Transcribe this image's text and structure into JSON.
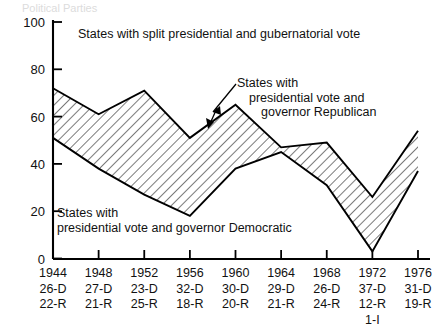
{
  "figure": {
    "top_partial_text": "Political Parties",
    "background_color": "#ffffff",
    "line_color": "#000000",
    "hatch_color": "#333333"
  },
  "yaxis": {
    "ticks": [
      "0",
      "20",
      "40",
      "60",
      "80",
      "100"
    ],
    "min": 0,
    "max": 100
  },
  "xaxis": {
    "columns": [
      {
        "year": "1944",
        "dem": "26-D",
        "rep": "22-R",
        "ind": ""
      },
      {
        "year": "1948",
        "dem": "27-D",
        "rep": "21-R",
        "ind": ""
      },
      {
        "year": "1952",
        "dem": "23-D",
        "rep": "25-R",
        "ind": ""
      },
      {
        "year": "1956",
        "dem": "32-D",
        "rep": "18-R",
        "ind": ""
      },
      {
        "year": "1960",
        "dem": "30-D",
        "rep": "20-R",
        "ind": ""
      },
      {
        "year": "1964",
        "dem": "29-D",
        "rep": "21-R",
        "ind": ""
      },
      {
        "year": "1968",
        "dem": "26-D",
        "rep": "24-R",
        "ind": ""
      },
      {
        "year": "1972",
        "dem": "37-D",
        "rep": "12-R",
        "ind": "1-I"
      },
      {
        "year": "1976",
        "dem": "31-D",
        "rep": "19-R",
        "ind": ""
      }
    ]
  },
  "annotations": {
    "split_label": "States with split presidential and gubernatorial vote",
    "republican_label_line1": "States with",
    "republican_label_line2": "presidential vote and",
    "republican_label_line3": "governor Republican",
    "democratic_label_line1": "States with",
    "democratic_label_line2": "presidential vote and governor Democratic"
  },
  "chart_data": {
    "type": "area",
    "title": "States with split presidential and gubernatorial vote",
    "xlabel": "",
    "ylabel": "",
    "ylim": [
      0,
      100
    ],
    "grid": false,
    "legend_position": "inline-annotations",
    "categories": [
      "1944",
      "1948",
      "1952",
      "1956",
      "1960",
      "1964",
      "1968",
      "1972",
      "1976"
    ],
    "series": [
      {
        "name": "States with presidential vote and governor Republican (upper boundary)",
        "values": [
          72,
          61,
          71,
          51,
          65,
          47,
          49,
          26,
          54
        ]
      },
      {
        "name": "States with presidential vote and governor Democratic (lower boundary)",
        "values": [
          51,
          38,
          27,
          18,
          38,
          45,
          31,
          3,
          37
        ]
      }
    ]
  }
}
